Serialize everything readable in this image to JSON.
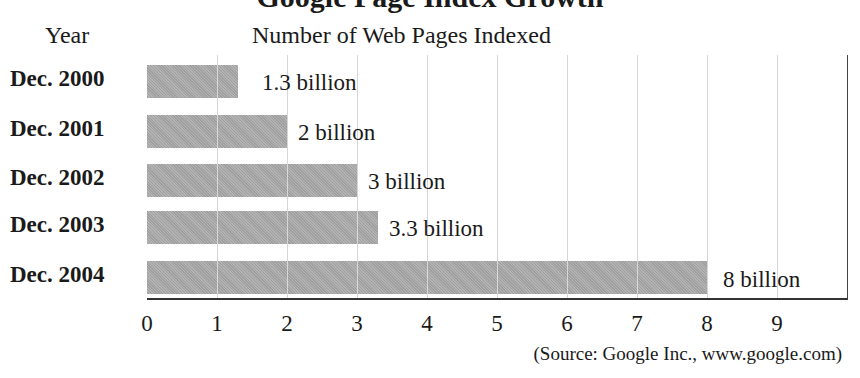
{
  "chart_data": {
    "type": "bar",
    "orientation": "horizontal",
    "title": "Google Page Index Growth",
    "title_visible": "partially cropped at top",
    "categories": [
      "Dec. 2000",
      "Dec. 2001",
      "Dec. 2002",
      "Dec. 2003",
      "Dec. 2004"
    ],
    "values": [
      1.3,
      2,
      3,
      3.3,
      8
    ],
    "value_labels": [
      "1.3 billion",
      "2 billion",
      "3 billion",
      "3.3 billion",
      "8 billion"
    ],
    "units": "billion",
    "xlabel": "Number of Web Pages Indexed",
    "ylabel": "Year",
    "xlim": [
      0,
      10
    ],
    "x_ticks": [
      "0",
      "1",
      "2",
      "3",
      "4",
      "5",
      "6",
      "7",
      "8",
      "9"
    ],
    "grid": "vertical",
    "legend": "none",
    "source": "(Source: Google Inc., www.google.com)",
    "bar_color": "#a9a9a9"
  },
  "header": {
    "title": "Google Page Index Growth",
    "year_label": "Year",
    "metric_label": "Number of Web Pages Indexed"
  }
}
